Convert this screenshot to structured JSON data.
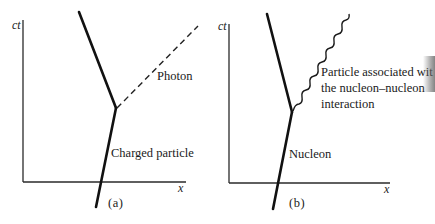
{
  "figure": {
    "panels": [
      {
        "id": "a",
        "panel_label": "(a)",
        "y_axis_label": "ct",
        "x_axis_label": "x",
        "incoming_label": "Charged particle",
        "emitted_label": "Photon",
        "emitted_style": "dashed"
      },
      {
        "id": "b",
        "panel_label": "(b)",
        "y_axis_label": "ct",
        "x_axis_label": "x",
        "incoming_label": "Nucleon",
        "emitted_label_lines": [
          "Particle associated wit",
          "the nucleon–nucleon",
          "interaction"
        ],
        "emitted_style": "wavy"
      }
    ],
    "colors": {
      "background": "#ffffff",
      "ink": "#1a1a1a"
    }
  }
}
